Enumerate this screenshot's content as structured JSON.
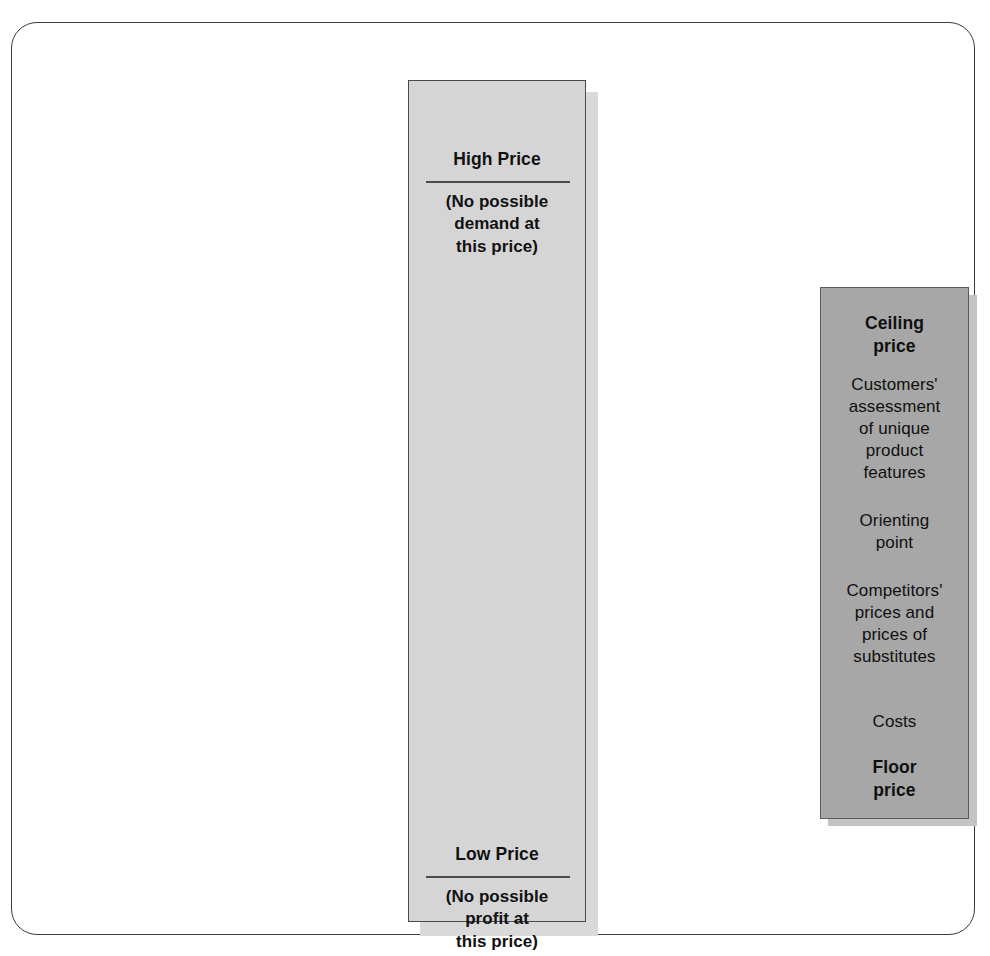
{
  "figure": {
    "type": "pricing-range-diagram",
    "colors": {
      "frame_border": "#3a3a3a",
      "outer_band_fill": "#d5d5d5",
      "outer_band_border": "#4a4a4a",
      "inner_box_fill": "#a7a7a7",
      "inner_box_border": "#5a5a5a",
      "text": "#111111",
      "shadow": "#c3c3c3"
    }
  },
  "price_band": {
    "high": {
      "title": "High Price",
      "note_lines": [
        "(No possible",
        "demand at",
        "this price)"
      ],
      "note_text": "(No possible demand at this price)"
    },
    "low": {
      "title": "Low Price",
      "note_lines": [
        "(No possible",
        "profit at",
        "this price)"
      ],
      "note_text": "(No possible profit at this price)"
    }
  },
  "inner_box": {
    "items": [
      {
        "label_lines": [
          "Ceiling",
          "price"
        ],
        "text": "Ceiling price",
        "emphasis": "bold"
      },
      {
        "label_lines": [
          "Customers'",
          "assessment",
          "of unique",
          "product",
          "features"
        ],
        "text": "Customers' assessment of unique product features",
        "emphasis": "regular"
      },
      {
        "label_lines": [
          "Orienting",
          "point"
        ],
        "text": "Orienting point",
        "emphasis": "regular"
      },
      {
        "label_lines": [
          "Competitors'",
          "prices and",
          "prices of",
          "substitutes"
        ],
        "text": "Competitors' prices and prices of substitutes",
        "emphasis": "regular"
      },
      {
        "label_lines": [
          "Costs"
        ],
        "text": "Costs",
        "emphasis": "regular"
      },
      {
        "label_lines": [
          "Floor",
          "price"
        ],
        "text": "Floor price",
        "emphasis": "bold"
      }
    ]
  }
}
